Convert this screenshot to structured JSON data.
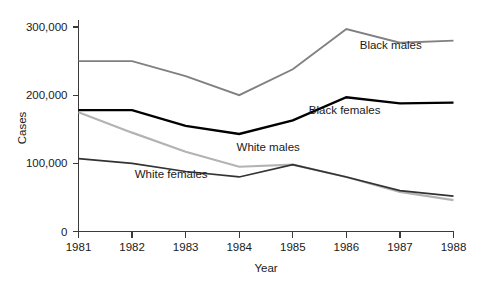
{
  "chart_data": {
    "type": "line",
    "title": "",
    "xlabel": "Year",
    "ylabel": "Cases",
    "x": [
      1981,
      1982,
      1983,
      1984,
      1985,
      1986,
      1987,
      1988
    ],
    "xtick_labels": [
      "1981",
      "1982",
      "1983",
      "1984",
      "1985",
      "1986",
      "1987",
      "1988"
    ],
    "ytick_labels": [
      "0",
      "100,000",
      "200,000",
      "300,000"
    ],
    "ytick_values": [
      0,
      100000,
      200000,
      300000
    ],
    "ylim": [
      0,
      300000
    ],
    "xlim": [
      1981,
      1988
    ],
    "grid": false,
    "legend_position": "inline-annotations",
    "series": [
      {
        "name": "Black males",
        "label": "Black males",
        "color": "#808080",
        "stroke_width": 1.9,
        "values": [
          250000,
          250000,
          228000,
          200000,
          238000,
          297000,
          277000,
          280000
        ],
        "label_x": 1986.25,
        "label_y": 268000
      },
      {
        "name": "Black females",
        "label": "Black females",
        "color": "#000000",
        "stroke_width": 2.4,
        "values": [
          178000,
          178000,
          155000,
          143000,
          163000,
          197000,
          188000,
          189000
        ],
        "label_x": 1985.3,
        "label_y": 172000
      },
      {
        "name": "White males",
        "label": "White males",
        "color": "#b3b3b3",
        "stroke_width": 2.2,
        "values": [
          175000,
          145000,
          117000,
          95000,
          98000,
          80000,
          58000,
          46000
        ],
        "label_x": 1983.95,
        "label_y": 118000
      },
      {
        "name": "White females",
        "label": "White females",
        "color": "#333333",
        "stroke_width": 1.7,
        "values": [
          107000,
          100000,
          88000,
          80000,
          98000,
          80000,
          60000,
          52000
        ],
        "label_x": 1982.05,
        "label_y": 78000
      }
    ]
  }
}
